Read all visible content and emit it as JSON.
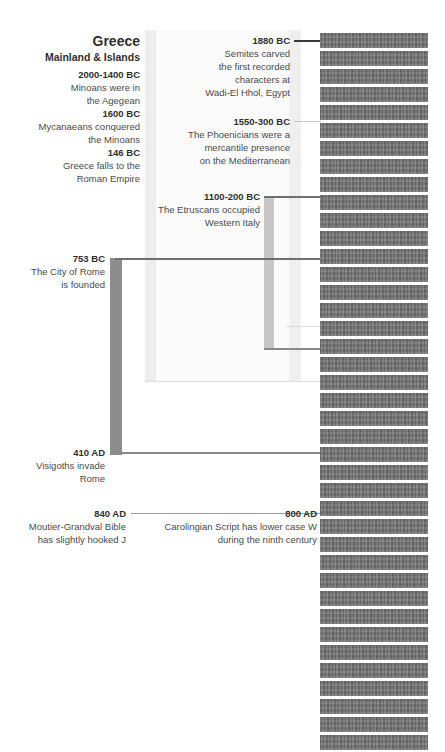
{
  "figure": {
    "title_block": {
      "title": "Greece",
      "subtitle": "Mainland & Islands"
    }
  },
  "colors": {
    "redact_bar": "#6e6e6e",
    "dark_band": "#8d8d8d",
    "light_band": "#ededed",
    "pale_band": "#f4f4f4",
    "rule_dark": "#707070",
    "rule_light": "#c9c9c9",
    "text_bold": "#2f2f2f",
    "text_body": "#4a4a4a"
  },
  "left_column": {
    "entries": [
      {
        "year": "2000-1400 BC",
        "desc": "Minoans were in\nthe Agegean"
      },
      {
        "year": "1600 BC",
        "desc": "Mycanaeans conquered\nthe Minoans"
      },
      {
        "year": "146 BC",
        "desc": "Greece falls to the\nRoman Empire"
      },
      {
        "year": "753 BC",
        "desc": "The City of Rome\nis founded"
      },
      {
        "year": "410 AD",
        "desc": "Visigoths invade\nRome"
      },
      {
        "year": "840 AD",
        "desc": "Moutier-Grandval Bible\nhas slightly hooked J"
      }
    ]
  },
  "middle_column": {
    "entries": [
      {
        "year": "1880 BC",
        "desc": "Semites carved\nthe  first recorded\ncharacters at\nWadi-El Hhol, Egypt"
      },
      {
        "year": "1550-300 BC",
        "desc": "The Phoenicians were a\nmercantile presence\non the Mediterranean"
      },
      {
        "year": "1100-200 BC",
        "desc": "The Etruscans occupied\nWestern Italy"
      },
      {
        "year": "800 AD",
        "desc": "Carolingian Script has lower case W\nduring the ninth century"
      }
    ]
  },
  "redacted_column": {
    "bar_count": 40,
    "note": "obscured text rows"
  }
}
